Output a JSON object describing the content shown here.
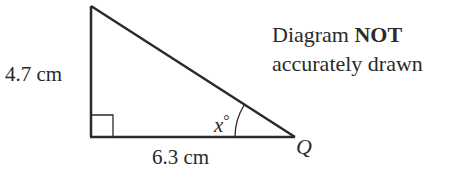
{
  "diagram": {
    "type": "right-triangle",
    "note": {
      "line1_prefix": "Diagram",
      "line1_bold": "NOT",
      "line2": "accurately drawn"
    },
    "sides": {
      "vertical": {
        "label": "4.7 cm",
        "value": 4.7,
        "unit": "cm"
      },
      "horizontal": {
        "label": "6.3 cm",
        "value": 6.3,
        "unit": "cm"
      }
    },
    "angle": {
      "label": "x°",
      "symbol": "x",
      "unit": "°",
      "vertex": "Q"
    },
    "vertices": {
      "Q": {
        "label": "Q"
      }
    },
    "right_angle_marker": true,
    "colors": {
      "stroke": "#2a2a2a",
      "background": "#ffffff"
    }
  }
}
